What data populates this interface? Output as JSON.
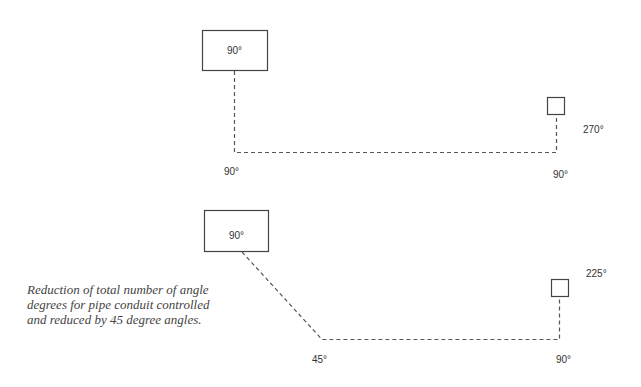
{
  "diagram": {
    "colors": {
      "line": "#555555",
      "box_border": "#444444",
      "text": "#333333",
      "caption": "#444444"
    },
    "top": {
      "start_box_label": "90°",
      "end_box_label": "",
      "corner_left_label": "90°",
      "corner_right_label": "90°",
      "end_angle_label": "270°"
    },
    "bottom": {
      "start_box_label": "90°",
      "end_box_label": "",
      "corner_left_label": "45°",
      "corner_right_label": "90°",
      "end_angle_label": "225°"
    },
    "caption": {
      "lines": [
        "Reduction of total number of angle",
        "degrees for pipe conduit controlled",
        "and reduced by 45 degree angles."
      ]
    }
  }
}
